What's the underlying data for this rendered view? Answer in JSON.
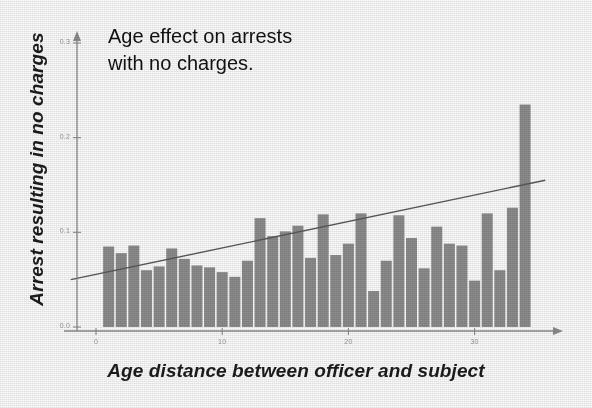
{
  "chart_data": {
    "type": "bar",
    "title": "Age effect on arrests\nwith no charges.",
    "xlabel": "Age distance between officer and subject",
    "ylabel": "Arrest resulting in no charges",
    "xlim": [
      -2,
      36
    ],
    "ylim": [
      0.0,
      0.3
    ],
    "grid": false,
    "legend": null,
    "xticks": [
      0,
      10,
      20,
      30
    ],
    "xticklabels": [
      "0",
      "10",
      "20",
      "30"
    ],
    "yticks": [
      0.0,
      0.1,
      0.2,
      0.3
    ],
    "yticklabels": [
      "0.0",
      "0.1",
      "0.2",
      "0.3"
    ],
    "bar_color": "#8d8d8d",
    "line_color": "#5a5a5a",
    "x": [
      1,
      2,
      3,
      4,
      5,
      6,
      7,
      8,
      9,
      10,
      11,
      12,
      13,
      14,
      15,
      16,
      17,
      18,
      19,
      20,
      21,
      22,
      23,
      24,
      25,
      26,
      27,
      28,
      29,
      30,
      31,
      32,
      33,
      34
    ],
    "values": [
      0.085,
      0.078,
      0.086,
      0.06,
      0.064,
      0.083,
      0.072,
      0.065,
      0.063,
      0.058,
      0.053,
      0.07,
      0.115,
      0.096,
      0.101,
      0.107,
      0.073,
      0.119,
      0.076,
      0.088,
      0.12,
      0.038,
      0.07,
      0.118,
      0.094,
      0.062,
      0.106,
      0.088,
      0.086,
      0.049,
      0.12,
      0.06,
      0.126,
      0.235
    ],
    "trendline": {
      "name": "fitted trend",
      "x_start": -2.0,
      "y_start": 0.05,
      "x_end": 35.6,
      "y_end": 0.155
    }
  },
  "figure": {
    "title_text": "Age effect on arrests\nwith no charges.",
    "y_axis_title": "Arrest resulting in no charges",
    "x_axis_title": "Age distance between officer and subject"
  }
}
